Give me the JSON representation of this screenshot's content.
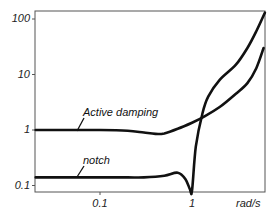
{
  "chart_data": {
    "type": "line",
    "title": "",
    "xlabel": "rad/s",
    "ylabel": "",
    "xscale": "log",
    "yscale": "log",
    "xlim": [
      0.02,
      6.2
    ],
    "ylim": [
      0.077,
      140
    ],
    "grid": false,
    "legend": "inline labels",
    "x_ticks": [
      "0.1",
      "1"
    ],
    "y_ticks": [
      "0.1",
      "1",
      "10",
      "100"
    ],
    "series": [
      {
        "name": "Active damping",
        "x": [
          0.02,
          0.05,
          0.1,
          0.2,
          0.3,
          0.4,
          0.5,
          0.7,
          1.0,
          1.4,
          2.0,
          3.0,
          4.0,
          5.0,
          6.0
        ],
        "y": [
          1.0,
          1.0,
          1.0,
          0.97,
          0.9,
          0.85,
          0.87,
          1.05,
          1.35,
          1.8,
          2.6,
          4.5,
          7.0,
          13,
          30
        ]
      },
      {
        "name": "notch",
        "x": [
          0.02,
          0.05,
          0.1,
          0.2,
          0.3,
          0.5,
          0.7,
          0.85,
          0.95,
          1.0,
          1.1,
          1.3,
          1.5,
          2.0,
          3.0,
          4.0,
          5.0,
          6.2
        ],
        "y": [
          0.14,
          0.14,
          0.14,
          0.14,
          0.14,
          0.15,
          0.17,
          0.13,
          0.085,
          0.08,
          0.5,
          2.0,
          4.0,
          8.0,
          15,
          30,
          60,
          130
        ]
      }
    ],
    "annotations": [
      "Active damping",
      "notch"
    ]
  },
  "axes": {
    "x_unit": "rad/s",
    "x_ticks": [
      {
        "label": "0.1",
        "value": 0.1
      },
      {
        "label": "1",
        "value": 1
      }
    ],
    "y_ticks": [
      {
        "label": "100",
        "value": 100
      },
      {
        "label": "10",
        "value": 10
      },
      {
        "label": "1",
        "value": 1
      },
      {
        "label": "0.1",
        "value": 0.1
      }
    ]
  },
  "labels": {
    "active_damping": "Active damping",
    "notch": "notch"
  },
  "colors": {
    "line": "#111111",
    "frame": "#555555"
  }
}
